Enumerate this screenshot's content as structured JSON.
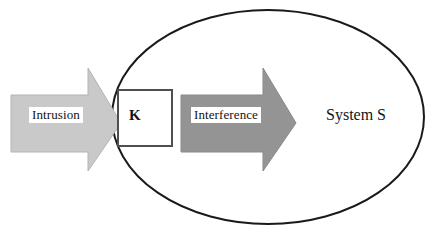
{
  "diagram": {
    "type": "block-flow-diagram",
    "background_color": "#ffffff",
    "nodes": {
      "intrusion_arrow": {
        "label": "Intrusion",
        "shape": "block-arrow-right",
        "fill_color": "#c9c9c9",
        "stroke_color": "#b0b0b0",
        "label_plate_color": "#ffffff"
      },
      "k_box": {
        "label": "K",
        "shape": "square",
        "fill_color": "#ffffff",
        "stroke_color": "#4f4f4f"
      },
      "interference_arrow": {
        "label": "Interference",
        "shape": "block-arrow-right",
        "fill_color": "#949494",
        "stroke_color": "#848484",
        "label_plate_color": "#ffffff"
      },
      "system_ellipse": {
        "label": "System S",
        "shape": "ellipse",
        "fill_color": "#ffffff",
        "stroke_color": "#1a1a1a"
      }
    },
    "flow_order": [
      "Intrusion",
      "K",
      "Interference",
      "System S"
    ]
  }
}
